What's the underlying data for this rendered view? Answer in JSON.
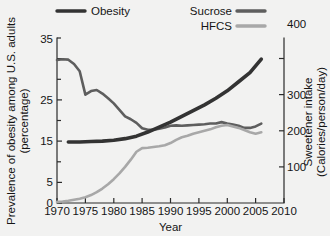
{
  "chart_data": {
    "type": "line",
    "title": "",
    "xlabel": "Year",
    "ylabel": "Prevalence of obesity among U.S. adults (percentage)",
    "ylabel_line1": "Prevalence of obesity among U.S. adults",
    "ylabel_line2": "(percentage)",
    "y2label": "Sweetener intake (Calories/person/day)",
    "y2label_line1": "Sweetener intake",
    "y2label_line2": "(Calories/person/day)",
    "xlim": [
      1970,
      2010
    ],
    "ylim": [
      0,
      40
    ],
    "y2lim": [
      0,
      457
    ],
    "grid": false,
    "legend_position": "top",
    "xticks": [
      1970,
      1975,
      1980,
      1985,
      1990,
      1995,
      2000,
      2005,
      2010
    ],
    "xtick_labels": [
      "1970",
      "1975",
      "1980",
      "1985",
      "1990",
      "1995",
      "2000",
      "2005",
      "2010"
    ],
    "yticks": [
      0,
      5,
      15,
      25,
      35
    ],
    "ytick_labels": [
      "0",
      "5",
      "15",
      "25",
      "35"
    ],
    "yminorticks": [
      10,
      20,
      30
    ],
    "y2ticks": [
      100,
      200,
      300,
      400
    ],
    "y2tick_labels": [
      "100",
      "200",
      "300",
      "400"
    ],
    "series": [
      {
        "name": "Obesity",
        "axis": "left",
        "color": "#333333",
        "units": "percentage",
        "x": [
          1972,
          1974,
          1976,
          1978,
          1980,
          1982,
          1984,
          1986,
          1988,
          1990,
          1992,
          1994,
          1996,
          1998,
          2000,
          2002,
          2004,
          2006
        ],
        "values": [
          14.8,
          14.8,
          14.9,
          15.0,
          15.2,
          15.6,
          16.2,
          17.2,
          18.4,
          19.6,
          21.0,
          22.4,
          23.8,
          25.4,
          27.2,
          29.4,
          31.6,
          34.9
        ]
      },
      {
        "name": "Sucrose",
        "axis": "right",
        "color": "#5e5e5e",
        "units": "Calories/person/day",
        "x": [
          1970,
          1971,
          1972,
          1973,
          1974,
          1975,
          1976,
          1977,
          1978,
          1979,
          1980,
          1981,
          1982,
          1983,
          1984,
          1985,
          1986,
          1987,
          1988,
          1989,
          1990,
          1991,
          1992,
          1993,
          1994,
          1995,
          1996,
          1997,
          1998,
          1999,
          2000,
          2001,
          2002,
          2003,
          2004,
          2005,
          2006
        ],
        "values": [
          396,
          398,
          397,
          385,
          365,
          300,
          310,
          313,
          303,
          290,
          276,
          258,
          240,
          232,
          222,
          207,
          203,
          203,
          206,
          209,
          214,
          215,
          214,
          215,
          216,
          217,
          218,
          220,
          220,
          224,
          220,
          217,
          214,
          208,
          208,
          212,
          220
        ]
      },
      {
        "name": "HFCS",
        "axis": "right",
        "color": "#a8a8a8",
        "units": "Calories/person/day",
        "x": [
          1970,
          1971,
          1972,
          1973,
          1974,
          1975,
          1976,
          1977,
          1978,
          1979,
          1980,
          1981,
          1982,
          1983,
          1984,
          1985,
          1986,
          1987,
          1988,
          1989,
          1990,
          1991,
          1992,
          1993,
          1994,
          1995,
          1996,
          1997,
          1998,
          1999,
          2000,
          2001,
          2002,
          2003,
          2004,
          2005,
          2006
        ],
        "values": [
          3,
          4,
          6,
          9,
          12,
          16,
          22,
          30,
          40,
          52,
          66,
          82,
          100,
          120,
          142,
          152,
          153,
          155,
          157,
          160,
          166,
          175,
          182,
          186,
          192,
          196,
          200,
          204,
          210,
          214,
          216,
          212,
          208,
          202,
          196,
          192,
          196
        ]
      }
    ],
    "legend": [
      {
        "label": "Obesity",
        "color": "#333333"
      },
      {
        "label": "Sucrose",
        "color": "#5e5e5e"
      },
      {
        "label": "HFCS",
        "color": "#a8a8a8"
      }
    ]
  },
  "colors": {
    "background": "#f2f2f1",
    "axis": "#2b2b2b",
    "text": "#151515",
    "obesity": "#333333",
    "sucrose": "#5e5e5e",
    "hfcs": "#a8a8a8"
  }
}
